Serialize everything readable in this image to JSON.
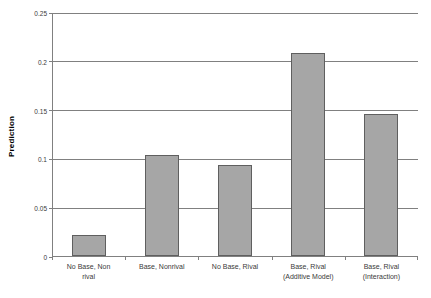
{
  "chart_data": {
    "type": "bar",
    "title": "",
    "xlabel": "",
    "ylabel": "Prediction",
    "categories": [
      "No Base, Non rival",
      "Base, Nonrival",
      "No Base, Rival",
      "Base, Rival (Additive Model)",
      "Base, Rival (Interaction)"
    ],
    "category_lines": [
      [
        "No Base, Non",
        "rival"
      ],
      [
        "Base, Nonrival"
      ],
      [
        "No Base, Rival"
      ],
      [
        "Base, Rival",
        "(Additive Model)"
      ],
      [
        "Base, Rival",
        "(Interaction)"
      ]
    ],
    "values": [
      0.022,
      0.104,
      0.093,
      0.208,
      0.145
    ],
    "ylim": [
      0,
      0.25
    ],
    "ytick_values": [
      0,
      0.05,
      0.1,
      0.15,
      0.2,
      0.25
    ],
    "ytick_labels": [
      "0",
      "0.05",
      "0.1",
      "0.15",
      "0.2",
      "0.25"
    ],
    "grid": true,
    "legend": "none",
    "bar_fill_color": "#a6a6a6",
    "bar_border_color": "#5f5f5f",
    "axis_color": "#808080",
    "text_color": "#3a3a3a"
  }
}
